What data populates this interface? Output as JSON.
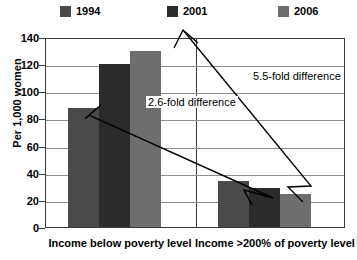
{
  "legend": {
    "items": [
      {
        "label": "1994",
        "color": "#4a4a4a",
        "x": 60
      },
      {
        "label": "2001",
        "color": "#2b2b2b",
        "x": 167
      },
      {
        "label": "2006",
        "color": "#6e6e6e",
        "x": 278
      }
    ]
  },
  "axis": {
    "y_title": "Per 1,000 women",
    "y_ticks": [
      "140",
      "120",
      "100",
      "80",
      "60",
      "40",
      "20",
      "0"
    ]
  },
  "annotations": [
    {
      "name": "fold-difference-2-6",
      "text": "2.6-fold difference",
      "x": 146,
      "y": 96
    },
    {
      "name": "fold-difference-5-5",
      "text": "5.5-fold difference",
      "x": 251,
      "y": 70
    }
  ],
  "chart_data": {
    "type": "bar",
    "title": "",
    "xlabel": "",
    "ylabel": "Per 1,000 women",
    "ylim": [
      0,
      140
    ],
    "ytick_step": 20,
    "grid": true,
    "legend_position": "top",
    "categories": [
      "Income below poverty level",
      "Income >200% of poverty level"
    ],
    "series": [
      {
        "name": "1994",
        "color": "#4a4a4a",
        "values": [
          88,
          34
        ]
      },
      {
        "name": "2001",
        "color": "#2b2b2b",
        "values": [
          120,
          29
        ]
      },
      {
        "name": "2006",
        "color": "#6e6e6e",
        "values": [
          130,
          24
        ]
      }
    ],
    "annotations": [
      {
        "text": "2.6-fold difference",
        "from_series": "1994",
        "from_category": "Income below poverty level",
        "to_series": "1994",
        "to_category": "Income >200% of poverty level"
      },
      {
        "text": "5.5-fold difference",
        "from_series": "2006",
        "from_category": "Income below poverty level",
        "to_series": "2006",
        "to_category": "Income >200% of poverty level"
      }
    ]
  }
}
